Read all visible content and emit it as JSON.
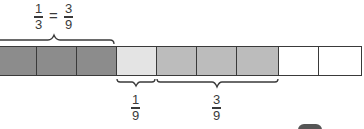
{
  "diagram": {
    "type": "fraction-bar",
    "total_parts": 9,
    "cells": [
      {
        "index": 0,
        "shade": "dark",
        "color": "#8c8c8c"
      },
      {
        "index": 1,
        "shade": "dark",
        "color": "#8c8c8c"
      },
      {
        "index": 2,
        "shade": "dark",
        "color": "#8c8c8c"
      },
      {
        "index": 3,
        "shade": "light",
        "color": "#e4e4e4"
      },
      {
        "index": 4,
        "shade": "medium",
        "color": "#bcbcbc"
      },
      {
        "index": 5,
        "shade": "medium",
        "color": "#bcbcbc"
      },
      {
        "index": 6,
        "shade": "medium",
        "color": "#bcbcbc"
      },
      {
        "index": 7,
        "shade": "white",
        "color": "#ffffff"
      },
      {
        "index": 8,
        "shade": "white",
        "color": "#ffffff"
      }
    ],
    "top_label": {
      "left": {
        "numerator": "1",
        "denominator": "3"
      },
      "equals": "=",
      "right": {
        "numerator": "3",
        "denominator": "9"
      },
      "spans_cells": [
        0,
        2
      ]
    },
    "bottom_labels": [
      {
        "numerator": "1",
        "denominator": "9",
        "spans_cells": [
          3,
          3
        ]
      },
      {
        "numerator": "3",
        "denominator": "9",
        "spans_cells": [
          4,
          6
        ]
      }
    ]
  }
}
